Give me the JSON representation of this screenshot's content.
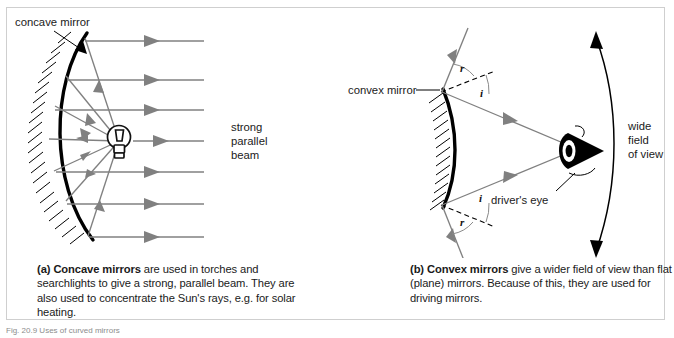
{
  "figure": {
    "number_text": "Fig. 20.9 Uses of curved mirrors",
    "panels": [
      {
        "id": "a",
        "diagram_labels": {
          "mirror_label": "concave mirror",
          "beam_label_line1": "strong",
          "beam_label_line2": "parallel",
          "beam_label_line3": "beam"
        },
        "caption_prefix": "(a) Concave mirrors",
        "caption_rest": " are used in torches and searchlights to give a strong, parallel beam. They are also used to concentrate the Sun's rays, e.g. for solar heating."
      },
      {
        "id": "b",
        "diagram_labels": {
          "mirror_label": "convex mirror",
          "eye_label": "driver's eye",
          "fov_line1": "wide",
          "fov_line2": "field",
          "fov_line3": "of view",
          "angle_r_top": "r",
          "angle_i_top": "i",
          "angle_i_bottom": "i",
          "angle_r_bottom": "r"
        },
        "caption_prefix": "(b) Convex mirrors",
        "caption_rest": " give a wider field of view than flat (plane) mirrors. Because of this, they are used for driving mirrors."
      }
    ]
  },
  "colors": {
    "ray": "#808080",
    "mirror": "#000000",
    "text": "#1a1a1a",
    "border": "#cfcfcf",
    "background": "#ffffff"
  }
}
